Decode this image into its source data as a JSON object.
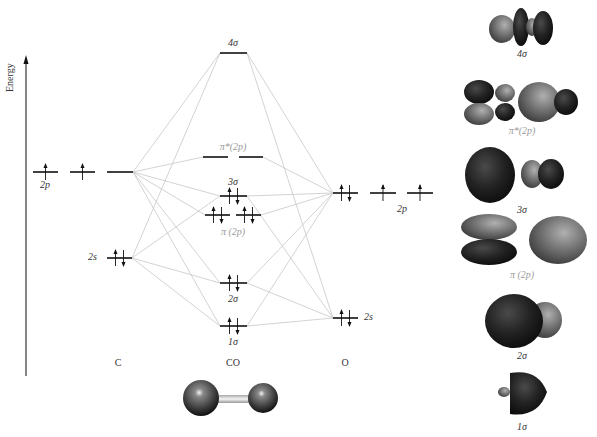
{
  "axis": {
    "label": "Energy"
  },
  "columns": {
    "left": "C",
    "middle": "CO",
    "right": "O"
  },
  "atoms": {
    "C": {
      "levels": [
        {
          "name": "2p",
          "label": "2p",
          "electrons": [
            "up",
            "up",
            ""
          ],
          "y": 172,
          "segments": [
            [
              33,
              58
            ],
            [
              70,
              95
            ],
            [
              107,
              133
            ]
          ]
        },
        {
          "name": "2s",
          "label": "2s",
          "electrons": [
            "updown"
          ],
          "y": 258,
          "segments": [
            [
              107,
              132
            ]
          ]
        }
      ]
    },
    "O": {
      "levels": [
        {
          "name": "2p",
          "label": "2p",
          "electrons": [
            "updown",
            "up",
            "up"
          ],
          "y": 193,
          "segments": [
            [
              333,
              358
            ],
            [
              370,
              396
            ],
            [
              407,
              433
            ]
          ]
        },
        {
          "name": "2s",
          "label": "2s",
          "electrons": [
            "updown"
          ],
          "y": 318,
          "segments": [
            [
              333,
              358
            ]
          ]
        }
      ]
    }
  },
  "molecular_orbitals": [
    {
      "name": "4σ",
      "label": "4σ",
      "y": 53,
      "segments": [
        [
          220,
          247
        ]
      ],
      "electrons": [
        ""
      ],
      "label_pos": "above",
      "grey": false
    },
    {
      "name": "π*(2p)",
      "label": "π*(2p)",
      "y": 157,
      "segments": [
        [
          203,
          228
        ],
        [
          239,
          263
        ]
      ],
      "electrons": [
        "",
        ""
      ],
      "label_pos": "above",
      "grey": true
    },
    {
      "name": "3σ",
      "label": "3σ",
      "y": 196,
      "segments": [
        [
          220,
          247
        ]
      ],
      "electrons": [
        "updown"
      ],
      "label_pos": "above",
      "grey": false
    },
    {
      "name": "π(2p)",
      "label": "π (2p)",
      "y": 215,
      "segments": [
        [
          205,
          230
        ],
        [
          236,
          261
        ]
      ],
      "electrons": [
        "updown",
        "updown"
      ],
      "label_pos": "below",
      "grey": true
    },
    {
      "name": "2σ",
      "label": "2σ",
      "y": 283,
      "segments": [
        [
          220,
          247
        ]
      ],
      "electrons": [
        "updown"
      ],
      "label_pos": "below",
      "grey": false
    },
    {
      "name": "1σ",
      "label": "1σ",
      "y": 326,
      "segments": [
        [
          220,
          247
        ]
      ],
      "electrons": [
        "updown"
      ],
      "label_pos": "below",
      "grey": false
    }
  ],
  "orbital_images": [
    {
      "name": "4σ",
      "label": "4σ"
    },
    {
      "name": "π*(2p)",
      "label": "π*(2p)"
    },
    {
      "name": "3σ",
      "label": "3σ"
    },
    {
      "name": "π(2p)",
      "label": "π (2p)"
    },
    {
      "name": "2σ",
      "label": "2σ"
    },
    {
      "name": "1σ",
      "label": "1σ"
    }
  ],
  "molecule": {
    "name": "CO",
    "atoms": [
      "C",
      "O"
    ]
  },
  "colors": {
    "line": "#111111",
    "correlation": "#c8c8c8",
    "grey_label": "#9a9a9a",
    "lobe_dark": "#1e1e1e",
    "lobe_light": "#777777"
  }
}
